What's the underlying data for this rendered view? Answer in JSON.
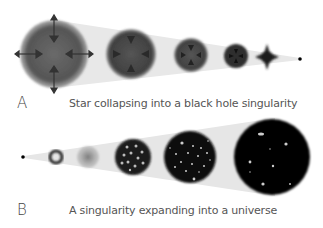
{
  "panels": [
    {
      "letter": "A",
      "caption": "Star collapsing into a black hole singularity",
      "stages": [
        "large star",
        "contracting star",
        "smaller star",
        "dense core",
        "collapsing core",
        "singularity"
      ]
    },
    {
      "letter": "B",
      "caption": "A singularity expanding into a universe",
      "stages": [
        "singularity",
        "ring",
        "diffuse cloud",
        "early universe",
        "expanding universe",
        "large universe"
      ]
    }
  ],
  "colors": {
    "background": "#ffffff",
    "cone": "#e6e6e6",
    "star": "#5a5a5a",
    "universe": "#0a0a0a",
    "text": "#555555"
  }
}
